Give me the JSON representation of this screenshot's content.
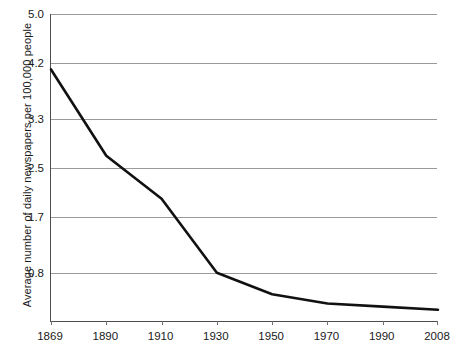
{
  "chart_data": {
    "type": "line",
    "title": "",
    "xlabel": "",
    "ylabel": "Average number of daily newspapers per 100,000 people",
    "categories": [
      "1869",
      "1890",
      "1910",
      "1930",
      "1950",
      "1970",
      "1990",
      "2008"
    ],
    "x": [
      1869,
      1890,
      1910,
      1930,
      1950,
      1970,
      1990,
      2008
    ],
    "values": [
      4.1,
      2.7,
      2.0,
      0.8,
      0.45,
      0.3,
      0.25,
      0.2
    ],
    "series": [
      {
        "name": "Average number of daily newspapers per 100,000 people",
        "values": [
          4.1,
          2.7,
          2.0,
          0.8,
          0.45,
          0.3,
          0.25,
          0.2
        ]
      }
    ],
    "ytick_labels": [
      "5.0",
      "4.2",
      "3.3",
      "2.5",
      "1.7",
      "0.8"
    ],
    "ytick_values": [
      5.0,
      4.2,
      3.3,
      2.5,
      1.7,
      0.8
    ],
    "ylim": [
      0.0,
      5.0
    ],
    "xlim": [
      1869,
      2008
    ],
    "grid": true,
    "legend": "none",
    "line_color": "#111111",
    "axis_color": "#4d4d4d",
    "grid_color": "#9a9a9a",
    "background_color": "#ffffff"
  }
}
